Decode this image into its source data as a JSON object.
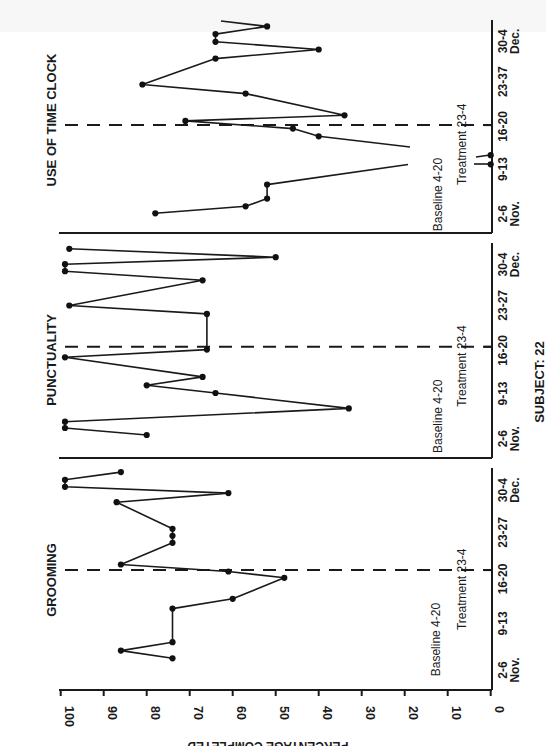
{
  "figure": {
    "y_axis_label": "PERCENTAGE COMPLETED",
    "y_ticks": [
      "100",
      "90",
      "80",
      "70",
      "60",
      "50",
      "40",
      "30",
      "20",
      "10",
      "0"
    ],
    "subject_label": "SUBJECT: 22",
    "orientation": "rotated 90 degrees counter-clockwise"
  },
  "chart_data": [
    {
      "type": "line",
      "title": "GROOMING",
      "xlabel": "Session dates (Nov. 2 - Dec. 4)",
      "ylabel": "PERCENTAGE COMPLETED",
      "ylim": [
        0,
        100
      ],
      "x_tick_labels": [
        "2-6 Nov.",
        "9-13",
        "16-20",
        "23-27",
        "30-4 Dec."
      ],
      "phases": [
        {
          "label": "Baseline 4-20",
          "sessions": "before line"
        },
        {
          "label": "Treatment 23-4",
          "sessions": "after line"
        }
      ],
      "phase_change_pos": 12.6,
      "series": [
        {
          "name": "Grooming",
          "pos": [
            0,
            1.1,
            2.3,
            7.1,
            8.5,
            11.5,
            12.4,
            13.4,
            16.5,
            17.5,
            18.5,
            22.3,
            23.6,
            24.5,
            25.5,
            26.6
          ],
          "values": [
            74,
            86,
            74,
            74,
            60,
            48,
            61,
            86,
            74,
            74,
            74,
            87,
            61,
            99,
            99,
            86
          ]
        }
      ]
    },
    {
      "type": "line",
      "title": "PUNCTUALITY",
      "xlabel": "Session dates (Nov. 2 - Dec. 4)",
      "ylabel": "PERCENTAGE COMPLETED",
      "ylim": [
        0,
        100
      ],
      "x_tick_labels": [
        "2-6 Nov.",
        "9-13",
        "16-20",
        "23-27",
        "30-4 Dec."
      ],
      "phases": [
        {
          "label": "Baseline 4-20",
          "sessions": "before line"
        },
        {
          "label": "Treatment 23-4",
          "sessions": "after line"
        }
      ],
      "phase_change_pos": 12.6,
      "series": [
        {
          "name": "Punctuality",
          "pos": [
            0,
            1,
            1.9,
            3.8,
            6,
            7.1,
            8.3,
            11.1,
            12.2,
            17.3,
            18.5,
            22.1,
            23.4,
            24.4,
            25.4,
            26.6
          ],
          "values": [
            80,
            99,
            99,
            33,
            64,
            80,
            67,
            99,
            66,
            66,
            98,
            67,
            99,
            99,
            50,
            98
          ]
        }
      ]
    },
    {
      "type": "line",
      "title": "USE OF TIME CLOCK",
      "xlabel": "Session dates (Nov. 2 - Dec. 4)",
      "ylabel": "PERCENTAGE COMPLETED",
      "ylim": [
        0,
        100
      ],
      "x_tick_labels": [
        "2-6 Nov.",
        "9-13",
        "16-20",
        "23-37",
        "30-4 Dec."
      ],
      "phases": [
        {
          "label": "Baseline 4-20",
          "sessions": "before line"
        },
        {
          "label": "Treatment 23-4",
          "sessions": "after line"
        }
      ],
      "phase_change_pos": 12.6,
      "series": [
        {
          "name": "Use of Time Clock",
          "pos": [
            0,
            1,
            2.1,
            4.1,
            7,
            8.3,
            11,
            12.1,
            13.2,
            14,
            17.1,
            18.4,
            22.1,
            23.4,
            24.5,
            25.6
          ],
          "values": [
            78,
            57,
            52,
            52,
            0,
            0,
            40,
            46,
            71,
            34,
            57,
            81,
            64,
            40,
            64,
            64
          ]
        }
      ],
      "extra_points": [
        {
          "pos": 26.7,
          "value": 52
        }
      ]
    }
  ],
  "panels": [
    {
      "title": "GROOMING",
      "baseline_label": "Baseline 4-20",
      "treatment_label": "Treatment 23-4",
      "ticks": [
        "2-6",
        "9-13",
        "16-20",
        "23-27",
        "30-4"
      ],
      "month_start": "Nov.",
      "month_end": "Dec."
    },
    {
      "title": "PUNCTUALITY",
      "baseline_label": "Baseline 4-20",
      "treatment_label": "Treatment 23-4",
      "ticks": [
        "2-6",
        "9-13",
        "16-20",
        "23-27",
        "30-4"
      ],
      "month_start": "Nov.",
      "month_end": "Dec."
    },
    {
      "title": "USE OF TIME CLOCK",
      "baseline_label": "Baseline 4-20",
      "treatment_label": "Treatment 23-4",
      "ticks": [
        "2-6",
        "9-13",
        "16-20",
        "23-37",
        "30-4"
      ],
      "month_start": "Nov.",
      "month_end": "Dec."
    }
  ]
}
